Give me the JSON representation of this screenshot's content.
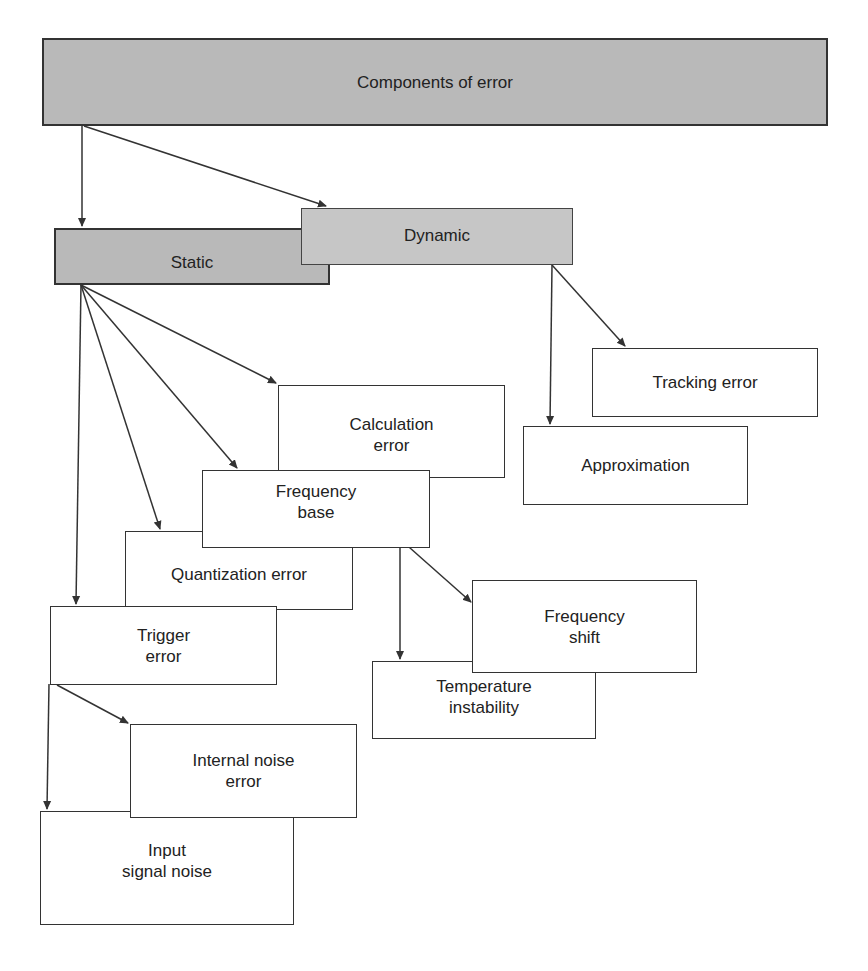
{
  "diagram": {
    "type": "hierarchy",
    "root": {
      "label": "Components of error",
      "children": [
        {
          "label": "Static",
          "children": [
            {
              "label": "Calculation\nerror"
            },
            {
              "label": "Frequency\nbase",
              "children": [
                {
                  "label": "Frequency\nshift"
                },
                {
                  "label": "Temperature\ninstability"
                }
              ]
            },
            {
              "label": "Quantization error"
            },
            {
              "label": "Trigger\nerror",
              "children": [
                {
                  "label": "Internal noise\nerror"
                },
                {
                  "label": "Input\nsignal noise"
                }
              ]
            }
          ]
        },
        {
          "label": "Dynamic",
          "children": [
            {
              "label": "Tracking error"
            },
            {
              "label": "Approximation"
            }
          ]
        }
      ]
    }
  },
  "nodes": {
    "components": "Components of error",
    "static": "Static",
    "dynamic": "Dynamic",
    "tracking": "Tracking error",
    "approximation": "Approximation",
    "calculation": "Calculation\nerror",
    "frequency_base": "Frequency\nbase",
    "quantization": "Quantization error",
    "trigger": "Trigger\nerror",
    "frequency_shift": "Frequency\nshift",
    "temperature": "Temperature\ninstability",
    "internal_noise": "Internal noise\nerror",
    "input_noise": "Input\nsignal noise"
  },
  "colors": {
    "root_fill": "#b9b9b9",
    "static_fill": "#b9b9b9",
    "dynamic_fill": "#c6c6c6",
    "leaf_fill": "#ffffff",
    "stroke": "#333333"
  }
}
